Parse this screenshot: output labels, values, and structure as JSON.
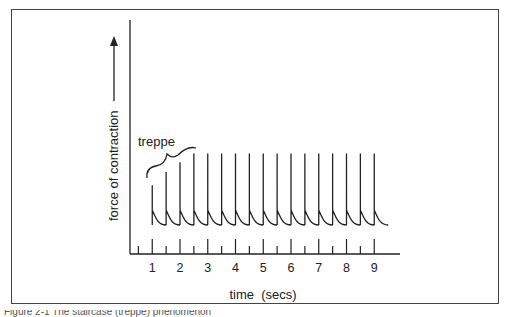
{
  "figure": {
    "ylabel": "force of contraction",
    "xlabel": "time  (secs)",
    "annotation": "treppe",
    "caption_partial": "Figure 2-1  The staircase (treppe) phenomenon"
  },
  "chart_data": {
    "type": "line",
    "title": "",
    "xlabel": "time (secs)",
    "ylabel": "force of contraction",
    "x_ticks": [
      "1",
      "2",
      "3",
      "4",
      "5",
      "6",
      "7",
      "8",
      "9"
    ],
    "xlim": [
      0,
      10
    ],
    "grid": false,
    "annotations": [
      {
        "text": "treppe",
        "spans_x": [
          1.0,
          2.5
        ],
        "note": "brace over first rising spikes"
      }
    ],
    "series": [
      {
        "name": "twitch amplitude",
        "x": [
          1.0,
          1.5,
          2.0,
          2.5,
          3.0,
          3.5,
          4.0,
          4.5,
          5.0,
          5.5,
          6.0,
          6.5,
          7.0,
          7.5,
          8.0,
          8.5,
          9.0
        ],
        "values": [
          0.63,
          0.75,
          0.84,
          0.92,
          0.92,
          0.92,
          0.92,
          0.92,
          0.92,
          0.92,
          0.92,
          0.92,
          0.92,
          0.92,
          0.92,
          0.92,
          0.92
        ]
      }
    ]
  }
}
